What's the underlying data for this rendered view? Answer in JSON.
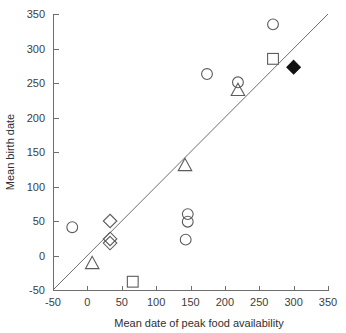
{
  "chart_data": {
    "type": "scatter",
    "title": "",
    "xlabel": "Mean date of peak food availability",
    "ylabel": "Mean birth date",
    "xlim": [
      -50,
      350
    ],
    "ylim": [
      -50,
      350
    ],
    "xticks": [
      -50,
      0,
      50,
      100,
      150,
      200,
      250,
      300,
      350
    ],
    "yticks": [
      -50,
      0,
      50,
      100,
      150,
      200,
      250,
      300,
      350
    ],
    "grid": false,
    "legend": "none",
    "annotations": [
      {
        "name": "identity-reference-line",
        "from": [
          -50,
          -50
        ],
        "to": [
          350,
          350
        ]
      }
    ],
    "series": [
      {
        "name": "open-circle",
        "marker": "circle",
        "fill": "none",
        "points": [
          [
            -22,
            41
          ],
          [
            270,
            335
          ],
          [
            174,
            263
          ],
          [
            219,
            251
          ],
          [
            146,
            60
          ],
          [
            146,
            49
          ],
          [
            143,
            23
          ]
        ]
      },
      {
        "name": "open-square",
        "marker": "square",
        "fill": "none",
        "points": [
          [
            270,
            285
          ],
          [
            66,
            -38
          ]
        ]
      },
      {
        "name": "open-triangle",
        "marker": "triangle",
        "fill": "none",
        "points": [
          [
            219,
            240
          ],
          [
            142,
            131
          ],
          [
            7,
            -11
          ]
        ]
      },
      {
        "name": "open-diamond",
        "marker": "diamond",
        "fill": "none",
        "points": [
          [
            33,
            50
          ],
          [
            33,
            24
          ],
          [
            33,
            18
          ]
        ]
      },
      {
        "name": "filled-diamond",
        "marker": "diamond",
        "fill": "solid",
        "points": [
          [
            300,
            273
          ]
        ]
      }
    ]
  },
  "axes": {
    "x_tick_labels": [
      "-50",
      "0",
      "50",
      "100",
      "150",
      "200",
      "250",
      "300",
      "350"
    ],
    "y_tick_labels": [
      "-50",
      "0",
      "50",
      "100",
      "150",
      "200",
      "250",
      "300",
      "350"
    ],
    "x_axis_title": "Mean date of peak food availability",
    "y_axis_title": "Mean birth date"
  },
  "colors": {
    "axis": "#6e6e6e",
    "marker_outline": "#5c5c5c",
    "marker_fill": "#111111",
    "text": "#3d3d3d",
    "background": "#ffffff"
  }
}
